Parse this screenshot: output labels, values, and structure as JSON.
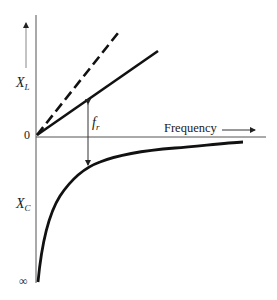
{
  "diagram": {
    "labels": {
      "xl_main": "X",
      "xl_sub": "L",
      "xc_main": "X",
      "xc_sub": "C",
      "fr_main": "f",
      "fr_sub": "r",
      "origin": "0",
      "infinity": "∞",
      "frequency": "Frequency"
    },
    "colors": {
      "ink": "#111111",
      "axis": "#555555",
      "background": "#ffffff"
    }
  }
}
